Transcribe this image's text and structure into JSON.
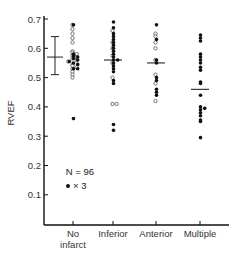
{
  "chart_data": {
    "type": "scatter",
    "subtype": "dot-strip-plot",
    "title": "",
    "xlabel": "",
    "ylabel": "RVEF",
    "ylim": [
      0,
      0.7
    ],
    "yticks": [
      0.1,
      0.2,
      0.3,
      0.4,
      0.5,
      0.6,
      0.7
    ],
    "ytick_labels": [
      "0.1",
      "0.2",
      "0.3",
      "0.4",
      "0.5",
      "0.6",
      "0.7"
    ],
    "grid": false,
    "categories": [
      "No infarct",
      "Inferior",
      "Anterior",
      "Multiple"
    ],
    "category_label_lines": [
      [
        "No",
        "infarct"
      ],
      [
        "Inferior"
      ],
      [
        "Anterior"
      ],
      [
        "Multiple"
      ]
    ],
    "reference_range": {
      "label": "normal mean ± SD",
      "mean": 0.57,
      "low": 0.51,
      "high": 0.64
    },
    "means": [
      0.57,
      0.56,
      0.55,
      0.46
    ],
    "series": [
      {
        "name": "No infarct",
        "filled": [
          0.68,
          0.58,
          0.575,
          0.57,
          0.565,
          0.56,
          0.555,
          0.55,
          0.545,
          0.53,
          0.53,
          0.36
        ],
        "open": [
          0.68,
          0.665,
          0.65,
          0.635,
          0.62,
          0.59,
          0.585,
          0.58,
          0.575,
          0.57,
          0.565,
          0.56,
          0.555,
          0.545,
          0.54,
          0.535,
          0.53,
          0.52,
          0.51,
          0.5
        ]
      },
      {
        "name": "Inferior",
        "filled": [
          0.69,
          0.67,
          0.65,
          0.64,
          0.63,
          0.62,
          0.61,
          0.6,
          0.59,
          0.58,
          0.57,
          0.56,
          0.56,
          0.55,
          0.54,
          0.53,
          0.52,
          0.49,
          0.48,
          0.34,
          0.32
        ],
        "open": [
          0.66,
          0.62,
          0.6,
          0.575,
          0.55,
          0.5,
          0.41,
          0.41
        ]
      },
      {
        "name": "Anterior",
        "filled": [
          0.68,
          0.63,
          0.56,
          0.55,
          0.5,
          0.49,
          0.46,
          0.45,
          0.44
        ],
        "open": [
          0.65,
          0.64,
          0.62,
          0.6,
          0.56,
          0.51,
          0.48,
          0.42
        ]
      },
      {
        "name": "Multiple",
        "filled": [
          0.645,
          0.635,
          0.625,
          0.58,
          0.57,
          0.56,
          0.55,
          0.535,
          0.525,
          0.485,
          0.48,
          0.44,
          0.4,
          0.395,
          0.39,
          0.38,
          0.37,
          0.355,
          0.35,
          0.295
        ]
      }
    ],
    "legend": {
      "n_text": "N = 96",
      "marker_text": "× 3"
    }
  }
}
